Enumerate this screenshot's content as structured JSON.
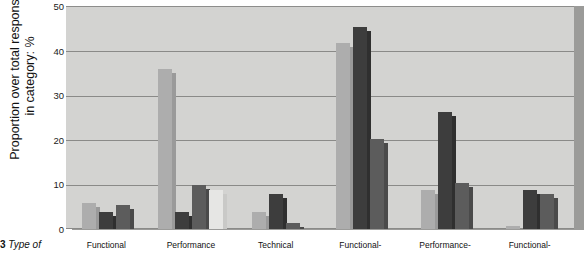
{
  "figure": {
    "caption_number": "3",
    "caption_text": "Type of"
  },
  "axes": {
    "ylabel": "Proportion over total response\nin category: %",
    "yticks": [
      "0",
      "10",
      "20",
      "30",
      "40",
      "50"
    ]
  },
  "colors": {
    "plot_background": "#d3d3d1",
    "gridline": "#8a8a88",
    "shadow_plate": "#9b9b99",
    "series_light": "#adadad",
    "series_light_shadow": "#9a9a9a",
    "series_dark": "#3d3d3d",
    "series_dark_shadow": "#2f2f2f",
    "series_medium": "#5c5c5c",
    "series_medium_shadow": "#4a4a4a",
    "series_pale": "#e6e6e4",
    "series_pale_shadow": "#c9c9c7"
  },
  "chart_data": {
    "type": "bar",
    "title": "",
    "xlabel": "",
    "ylabel": "Proportion over total response in category: %",
    "ylim": [
      0,
      50
    ],
    "yticks": [
      0,
      10,
      20,
      30,
      40,
      50
    ],
    "grid": true,
    "legend": "none",
    "categories": [
      "Functional",
      "Performance",
      "Technical",
      "Functional-",
      "Performance-",
      "Functional-"
    ],
    "series": [
      {
        "name": "Series 1",
        "color": "#adadad",
        "values": [
          6.0,
          36.0,
          4.0,
          42.0,
          9.0,
          1.0
        ]
      },
      {
        "name": "Series 2",
        "color": "#3d3d3d",
        "values": [
          4.0,
          4.0,
          8.0,
          45.5,
          26.5,
          9.0
        ]
      },
      {
        "name": "Series 3",
        "color": "#5c5c5c",
        "values": [
          5.5,
          10.0,
          1.5,
          20.5,
          10.5,
          8.0
        ]
      },
      {
        "name": "Series 4",
        "color": "#e6e6e4",
        "values": [
          0.0,
          9.0,
          0.0,
          0.0,
          0.0,
          0.0
        ]
      }
    ]
  }
}
